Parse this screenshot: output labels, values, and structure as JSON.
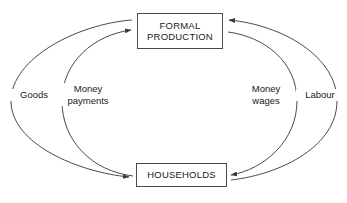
{
  "diagram": {
    "stroke_color": "#4a4a4a",
    "text_color": "#1a1a1a",
    "background_color": "#ffffff",
    "nodes": [
      {
        "id": "formal-production",
        "lines": [
          "FORMAL",
          "PRODUCTION"
        ]
      },
      {
        "id": "households",
        "lines": [
          "HOUSEHOLDS"
        ]
      }
    ],
    "edges": [
      {
        "id": "goods",
        "lines": [
          "Goods"
        ],
        "from": "formal-production",
        "to": "households",
        "side": "outer-left",
        "direction": "down"
      },
      {
        "id": "money-payments",
        "lines": [
          "Money",
          "payments"
        ],
        "from": "households",
        "to": "formal-production",
        "side": "inner-left",
        "direction": "up"
      },
      {
        "id": "money-wages",
        "lines": [
          "Money",
          "wages"
        ],
        "from": "formal-production",
        "to": "households",
        "side": "inner-right",
        "direction": "down"
      },
      {
        "id": "labour",
        "lines": [
          "Labour"
        ],
        "from": "households",
        "to": "formal-production",
        "side": "outer-right",
        "direction": "up"
      }
    ]
  }
}
